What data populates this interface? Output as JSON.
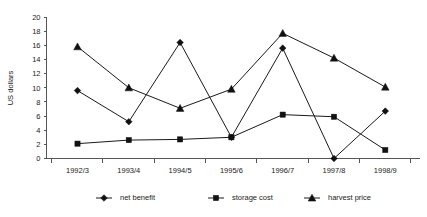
{
  "chart_data": {
    "type": "line",
    "title": "",
    "xlabel": "",
    "ylabel": "US dollars",
    "categories": [
      "1992/3",
      "1993/4",
      "1994/5",
      "1995/6",
      "1996/7",
      "1997/8",
      "1998/9"
    ],
    "ylim": [
      0,
      20
    ],
    "yticks": [
      0,
      2,
      4,
      6,
      8,
      10,
      12,
      14,
      16,
      18,
      20
    ],
    "grid": false,
    "legend_position": "bottom",
    "series": [
      {
        "name": "net benefit",
        "marker": "diamond",
        "color": "#111111",
        "values": [
          9.6,
          5.2,
          16.4,
          3.0,
          15.6,
          0.0,
          6.7
        ]
      },
      {
        "name": "storage cost",
        "marker": "square",
        "color": "#111111",
        "values": [
          2.1,
          2.6,
          2.7,
          3.0,
          6.2,
          5.9,
          1.2
        ]
      },
      {
        "name": "harvest price",
        "marker": "triangle",
        "color": "#111111",
        "values": [
          15.8,
          10.0,
          7.1,
          9.8,
          17.7,
          14.2,
          10.1
        ]
      }
    ]
  },
  "axis": {
    "y_tick_labels": [
      "20",
      "18",
      "16",
      "14",
      "12",
      "10",
      "8",
      "6",
      "4",
      "2",
      "0"
    ],
    "y_axis_title": "US dollars"
  },
  "legend": {
    "items": [
      {
        "label": "net benefit",
        "marker": "diamond-marker"
      },
      {
        "label": "storage cost",
        "marker": "square-marker"
      },
      {
        "label": "harvest price",
        "marker": "triangle-marker"
      }
    ]
  }
}
